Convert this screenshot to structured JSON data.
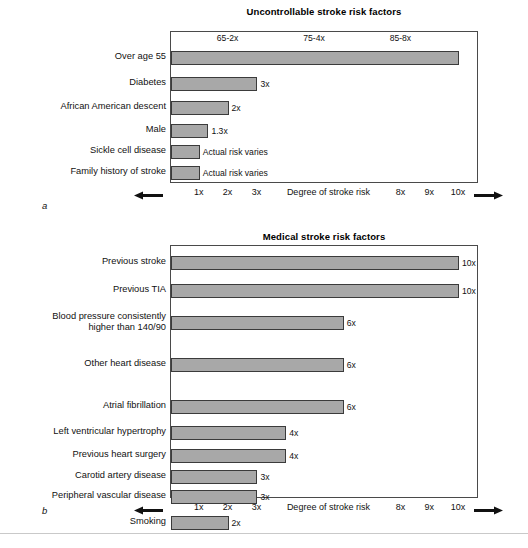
{
  "figure": {
    "letter_a": "a",
    "letter_b": "b",
    "caption": "",
    "bar_fill": "#a8a8a8",
    "bar_stroke": "#3b3b3b",
    "box_stroke": "#4a4a4a"
  },
  "chart_data": [
    {
      "type": "bar",
      "orientation": "horizontal",
      "panel": "a",
      "title": "Uncontrollable stroke risk factors",
      "xlabel": "Degree of stroke risk",
      "ylabel": "",
      "xlim": [
        0,
        10.6
      ],
      "grid": false,
      "legend": "none",
      "top_annotations": [
        {
          "label": "65-2x",
          "x": 2.0
        },
        {
          "label": "75-4x",
          "x": 5.0
        },
        {
          "label": "85-8x",
          "x": 8.0
        }
      ],
      "axis_ticks": [
        "1x",
        "2x",
        "3x",
        "8x",
        "9x",
        "10x"
      ],
      "axis_tick_values": [
        1,
        2,
        3,
        8,
        9,
        10
      ],
      "categories": [
        "Over age 55",
        "Diabetes",
        "African American descent",
        "Male",
        "Sickle cell disease",
        "Family history of stroke"
      ],
      "values": [
        10.0,
        3.0,
        2.0,
        1.3,
        1.0,
        1.0
      ],
      "value_labels": [
        "",
        "3x",
        "2x",
        "1.3x",
        "Actual risk varies",
        "Actual risk varies"
      ]
    },
    {
      "type": "bar",
      "orientation": "horizontal",
      "panel": "b",
      "title": "Medical stroke risk factors",
      "xlabel": "Degree of stroke risk",
      "ylabel": "",
      "xlim": [
        0,
        10.6
      ],
      "grid": false,
      "legend": "none",
      "top_annotations": [],
      "axis_ticks": [
        "1x",
        "2x",
        "3x",
        "8x",
        "9x",
        "10x"
      ],
      "axis_tick_values": [
        1,
        2,
        3,
        8,
        9,
        10
      ],
      "categories": [
        "Previous stroke",
        "Previous TIA",
        "Blood pressure consistently\nhigher than 140/90",
        "Other heart disease",
        "Atrial fibrillation",
        "Left ventricular hypertrophy",
        "Previous heart surgery",
        "Carotid artery disease",
        "Peripheral vascular disease",
        "Smoking"
      ],
      "values": [
        10.0,
        10.0,
        6.0,
        6.0,
        6.0,
        4.0,
        4.0,
        3.0,
        3.0,
        2.0
      ],
      "value_labels": [
        "10x",
        "10x",
        "6x",
        "6x",
        "6x",
        "4x",
        "4x",
        "3x",
        "3x",
        "2x"
      ]
    }
  ]
}
